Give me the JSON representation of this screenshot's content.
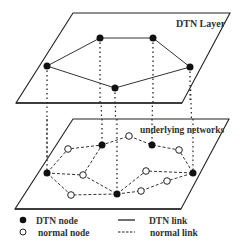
{
  "layers": {
    "top": {
      "label": "DTN Layer"
    },
    "bottom": {
      "label": "underlying networks"
    }
  },
  "legend": {
    "dtn_node": "DTN node",
    "normal_node": "normal node",
    "dtn_link": "DTN link",
    "normal_link": "normal link"
  },
  "colors": {
    "ink": "#111111",
    "plane": "#222222",
    "background": "#ffffff"
  },
  "diagram": {
    "dtn_nodes_top": [
      [
        47,
        66
      ],
      [
        100,
        38
      ],
      [
        153,
        38
      ],
      [
        190,
        67
      ],
      [
        115,
        88
      ]
    ],
    "dtn_links_top": [
      [
        0,
        1
      ],
      [
        1,
        2
      ],
      [
        2,
        3
      ],
      [
        3,
        4
      ],
      [
        4,
        0
      ]
    ],
    "dtn_nodes_bottom": [
      [
        47,
        173
      ],
      [
        102,
        145
      ],
      [
        152,
        145
      ],
      [
        193,
        173
      ],
      [
        117,
        194
      ]
    ],
    "normal_nodes_bottom": [
      [
        68,
        149
      ],
      [
        129,
        136
      ],
      [
        179,
        150
      ],
      [
        83,
        175
      ],
      [
        146,
        171
      ],
      [
        167,
        181
      ],
      [
        71,
        195
      ],
      [
        141,
        191
      ]
    ]
  }
}
